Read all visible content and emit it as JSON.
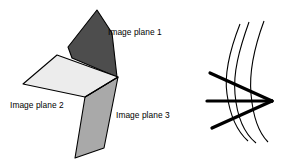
{
  "figure": {
    "background_color": "#ffffff",
    "width": 287,
    "height": 168,
    "labels": {
      "plane1": "Image plane 1",
      "plane2": "Image plane 2",
      "plane3": "Image plane 3"
    },
    "colors": {
      "plane1_fill": "#4d4d4d",
      "plane2_fill": "#ececec",
      "plane3_fill": "#a9a9a9",
      "outline": "#000000",
      "curve_stroke": "#000000",
      "thick_line_stroke": "#000000",
      "text": "#000000"
    },
    "planes": [
      {
        "name": "image-plane-1",
        "label": "Image plane 1",
        "fill": "#4d4d4d",
        "points": "97,10 68,47 72,58 117,77 112,33"
      },
      {
        "name": "image-plane-2",
        "label": "Image plane 2",
        "fill": "#ececec",
        "points": "57,55 23,84 85,97 118,77"
      },
      {
        "name": "image-plane-3",
        "label": "Image plane 3",
        "fill": "#a9a9a9",
        "points": "85,97 118,77 104,148 75,158"
      }
    ],
    "pencil": {
      "name": "epipolar-pencil",
      "vertex": {
        "x": 272,
        "y": 101
      },
      "thick_lines": [
        {
          "name": "epipolar-line-upper",
          "x1": 210,
          "y1": 73,
          "x2": 272,
          "y2": 101
        },
        {
          "name": "epipolar-line-middle",
          "x1": 207,
          "y1": 101,
          "x2": 272,
          "y2": 101
        },
        {
          "name": "epipolar-line-lower",
          "x1": 212,
          "y1": 128,
          "x2": 272,
          "y2": 101
        }
      ],
      "curves": [
        {
          "name": "curve-inner",
          "path": "M 240,24 C 229,52 224,74 227,94 C 230,116 238,132 248,141"
        },
        {
          "name": "curve-middle",
          "path": "M 249,22 C 239,50 233,73 235,94 C 237,117 245,134 256,143"
        },
        {
          "name": "curve-outer",
          "path": "M 264,21 C 254,48 249,72 251,94 C 253,117 259,133 268,142"
        }
      ]
    }
  }
}
